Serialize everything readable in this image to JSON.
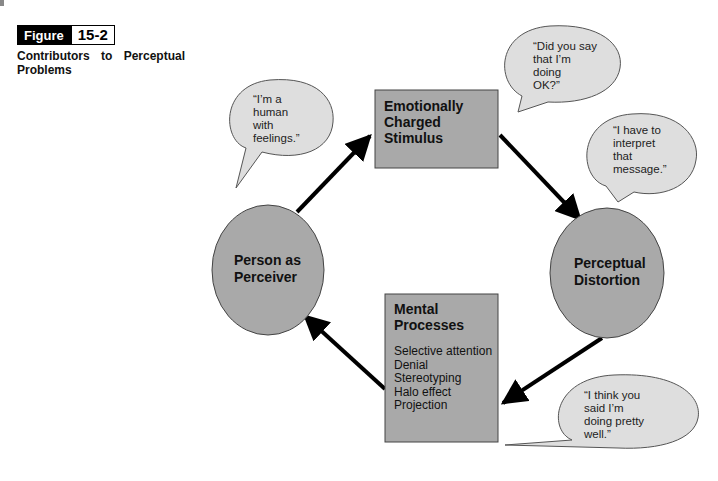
{
  "figure": {
    "label": "Figure",
    "number": "15-2",
    "caption_line1": [
      "Contributors",
      "to",
      "Perceptual"
    ],
    "caption_line2": "Problems"
  },
  "nodes": {
    "stimulus": {
      "title_lines": [
        "Emotionally",
        "Charged",
        "Stimulus"
      ]
    },
    "distortion": {
      "title_lines": [
        "Perceptual",
        "Distortion"
      ]
    },
    "mental": {
      "title_lines": [
        "Mental",
        "Processes"
      ],
      "items": [
        "Selective attention",
        "Denial",
        "Stereotyping",
        "Halo effect",
        "Projection"
      ]
    },
    "perceiver": {
      "title_lines": [
        "Person as",
        "Perceiver"
      ]
    }
  },
  "bubbles": {
    "perceiver": [
      "“I’m a",
      "human",
      "with",
      "feelings.”"
    ],
    "stimulus": [
      "“Did you say",
      "that I’m",
      "doing",
      "OK?”"
    ],
    "distortion": [
      "“I have to",
      "interpret",
      "that",
      "message.”"
    ],
    "mental": [
      "“I think you",
      "said I’m",
      "doing pretty",
      "well.”"
    ]
  },
  "colors": {
    "shape_fill": "#a9a9a9",
    "bubble_fill": "#dedede",
    "arrow": "#000000"
  }
}
